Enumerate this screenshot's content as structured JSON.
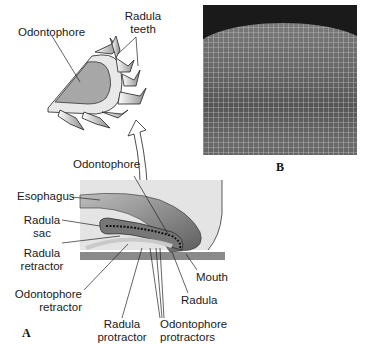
{
  "figure": {
    "panels": {
      "A": {
        "letter": "A",
        "inset_labels": {
          "odontophore": "Odontophore",
          "radula_teeth_line1": "Radula",
          "radula_teeth_line2": "teeth"
        },
        "labels": {
          "odontophore": "Odontophore",
          "esophagus": "Esophagus",
          "radula_sac_line1": "Radula",
          "radula_sac_line2": "sac",
          "radula_retractor_line1": "Radula",
          "radula_retractor_line2": "retractor",
          "odontophore_retractor_line1": "Odontophore",
          "odontophore_retractor_line2": "retractor",
          "radula_protractor_line1": "Radula",
          "radula_protractor_line2": "protractor",
          "odontophore_protractors_line1": "Odontophore",
          "odontophore_protractors_line2": "protractors",
          "radula": "Radula",
          "mouth": "Mouth"
        }
      },
      "B": {
        "letter": "B",
        "description": "micrograph of radula teeth rows"
      }
    },
    "colors": {
      "line": "#1a1a1a",
      "light_gray": "#d6d6d6",
      "mid_gray": "#9a9a9a",
      "dark_gray": "#6a6a6a",
      "background_box": "#e4e4e4"
    }
  }
}
